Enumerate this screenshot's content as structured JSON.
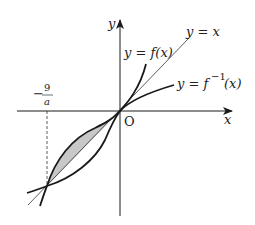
{
  "diagram": {
    "axes": {
      "x_label": "x",
      "y_label": "y",
      "origin_label": "O"
    },
    "curves": {
      "f": {
        "label": "y = f(x)"
      },
      "f_inverse": {
        "label_main": "y = f",
        "label_sup": "−1",
        "label_tail": "(x)"
      },
      "identity": {
        "label": "y = x"
      }
    },
    "marker": {
      "numerator": "9",
      "denominator": "a",
      "sign": "−"
    },
    "colors": {
      "stroke": "#1a1a1a",
      "shade": "#c8c8c8",
      "thin": "#333333"
    }
  }
}
